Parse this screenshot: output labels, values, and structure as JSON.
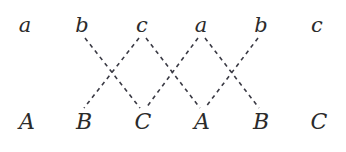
{
  "figure": {
    "type": "bipartite-crossing-diagram",
    "width": 346,
    "height": 152,
    "background_color": "#ffffff",
    "edge_color": "#3a3a44",
    "label_color": "#2b2b2b",
    "edge_style": "dashed",
    "edge_width": 1.6,
    "dash_pattern": "4 4"
  },
  "top_row": {
    "y": 25,
    "nodes": [
      {
        "id": "t0",
        "label": "a",
        "x": 25
      },
      {
        "id": "t1",
        "label": "b",
        "x": 82
      },
      {
        "id": "t2",
        "label": "c",
        "x": 142
      },
      {
        "id": "t3",
        "label": "a",
        "x": 201
      },
      {
        "id": "t4",
        "label": "b",
        "x": 261
      },
      {
        "id": "t5",
        "label": "c",
        "x": 317
      }
    ]
  },
  "bottom_row": {
    "y": 122,
    "nodes": [
      {
        "id": "b0",
        "label": "A",
        "x": 27
      },
      {
        "id": "b1",
        "label": "B",
        "x": 84
      },
      {
        "id": "b2",
        "label": "C",
        "x": 143
      },
      {
        "id": "b3",
        "label": "A",
        "x": 202
      },
      {
        "id": "b4",
        "label": "B",
        "x": 261
      },
      {
        "id": "b5",
        "label": "C",
        "x": 319
      }
    ]
  },
  "edges": [
    {
      "id": "e0",
      "from": "t1",
      "to": "b2",
      "x1": 85,
      "y1": 38,
      "x2": 140,
      "y2": 108
    },
    {
      "id": "e1",
      "from": "t2",
      "to": "b1",
      "x1": 139,
      "y1": 38,
      "x2": 84,
      "y2": 108
    },
    {
      "id": "e2",
      "from": "t2",
      "to": "b3",
      "x1": 146,
      "y1": 38,
      "x2": 200,
      "y2": 108
    },
    {
      "id": "e3",
      "from": "t3",
      "to": "b2",
      "x1": 198,
      "y1": 38,
      "x2": 146,
      "y2": 108
    },
    {
      "id": "e4",
      "from": "t3",
      "to": "b4",
      "x1": 205,
      "y1": 38,
      "x2": 259,
      "y2": 108
    },
    {
      "id": "e5",
      "from": "t4",
      "to": "b3",
      "x1": 258,
      "y1": 38,
      "x2": 205,
      "y2": 108
    }
  ],
  "crossings": [
    {
      "id": "x0",
      "x": 112,
      "y": 73
    },
    {
      "id": "x1",
      "x": 172,
      "y": 73
    },
    {
      "id": "x2",
      "x": 232,
      "y": 73
    }
  ],
  "isolated_nodes": [
    "t0",
    "t5",
    "b0",
    "b5"
  ]
}
